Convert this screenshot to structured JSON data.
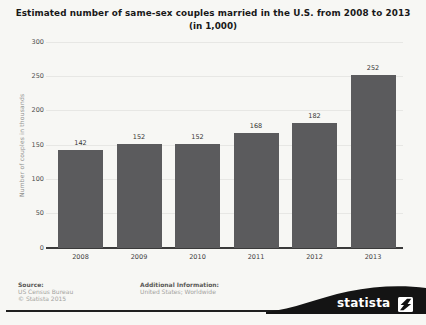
{
  "title": "Estimated number of same-sex couples married in the U.S. from 2008 to 2013",
  "subtitle": "(in 1,000)",
  "chart_data": {
    "type": "bar",
    "categories": [
      "2008",
      "2009",
      "2010",
      "2011",
      "2012",
      "2013"
    ],
    "values": [
      142,
      152,
      152,
      168,
      182,
      252
    ],
    "title": "Estimated number of same-sex couples married in the U.S. from 2008 to 2013 (in 1,000)",
    "xlabel": "",
    "ylabel": "Number of couples in thousands",
    "ylim": [
      0,
      300
    ],
    "yticks": [
      0,
      50,
      100,
      150,
      200,
      250,
      300
    ],
    "grid": true,
    "legend": "none",
    "bar_color": "#5b5b5d"
  },
  "footer": {
    "source_label": "Source:",
    "source_line1": "US Census Bureau",
    "source_line2": "© Statista 2015",
    "additional_label": "Additional Information:",
    "additional_line1": "United States; Worldwide"
  },
  "logo": {
    "brand": "statista",
    "icon": "statista-lightning-icon",
    "color": "#1a1a1a"
  }
}
